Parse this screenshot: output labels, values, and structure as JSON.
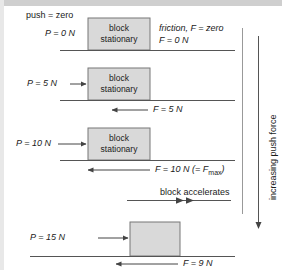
{
  "diagram": {
    "axis_label": "increasing push force",
    "colors": {
      "block_fill": "#d9d9d9",
      "block_stroke": "#777777",
      "line": "#555555",
      "text": "#1a1a1a",
      "band": "#cfcfcf"
    },
    "stages": [
      {
        "id": "stage-1",
        "heading": "push = zero",
        "push_label": "P = 0 N",
        "block_line1": "block",
        "block_line2": "stationary",
        "friction_note_line1": "friction, F = zero",
        "friction_note_line2": "F = 0 N",
        "friction_label": "",
        "has_push_arrow": false,
        "has_friction_arrow": false
      },
      {
        "id": "stage-2",
        "push_label": "P = 5 N",
        "block_line1": "block",
        "block_line2": "stationary",
        "friction_label": "F = 5 N",
        "has_push_arrow": true,
        "has_friction_arrow": true
      },
      {
        "id": "stage-3",
        "push_label": "P = 10 N",
        "block_line1": "block",
        "block_line2": "stationary",
        "friction_label_main": "F = 10 N (= F",
        "friction_label_sub": "max",
        "friction_label_end": ")",
        "has_push_arrow": true,
        "has_friction_arrow": true
      },
      {
        "id": "stage-4",
        "accelerates_label": "block accelerates",
        "push_label": "P = 15 N",
        "block_line1": "",
        "block_line2": "",
        "friction_label": "F = 9 N",
        "has_push_arrow": true,
        "has_friction_arrow": true,
        "has_acceleration_arrow": true
      }
    ]
  }
}
